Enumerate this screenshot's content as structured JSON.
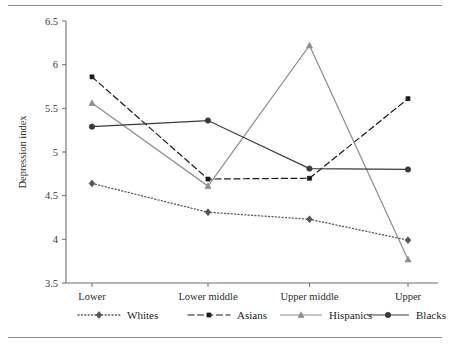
{
  "figure": {
    "has_top_rule": true,
    "has_bottom_rule": true,
    "rule_color": "#8a8a8a",
    "background": "#ffffff"
  },
  "axes": {
    "y_title": "Depression index",
    "y_ticks": [
      "6.5",
      "6",
      "5.5",
      "5",
      "4.5",
      "4",
      "3.5"
    ],
    "x_ticks": [
      "Lower",
      "Lower middle",
      "Upper middle",
      "Upper"
    ]
  },
  "legend": {
    "position": "bottom",
    "entries": [
      {
        "label": "Whites",
        "style": "dotted",
        "marker": "diamond",
        "color": "#555555"
      },
      {
        "label": "Asians",
        "style": "dashed",
        "marker": "square",
        "color": "#1a1a1a"
      },
      {
        "label": "Hispanics",
        "style": "solid",
        "marker": "triangle",
        "color": "#8e8e8e"
      },
      {
        "label": "Blacks",
        "style": "solid",
        "marker": "circle",
        "color": "#3a3a3a"
      }
    ]
  },
  "chart_data": {
    "type": "line",
    "title": "",
    "xlabel": "",
    "ylabel": "Depression index",
    "categories": [
      "Lower",
      "Lower middle",
      "Upper middle",
      "Upper"
    ],
    "ylim": [
      3.5,
      6.5
    ],
    "ytick_step": 0.5,
    "grid": false,
    "legend_position": "bottom",
    "series": [
      {
        "name": "Whites",
        "values": [
          4.64,
          4.31,
          4.23,
          3.99
        ],
        "line_style": "dotted",
        "marker": "diamond",
        "color": "#555555"
      },
      {
        "name": "Asians",
        "values": [
          5.86,
          4.69,
          4.7,
          5.61
        ],
        "line_style": "dashed",
        "marker": "square",
        "color": "#1a1a1a"
      },
      {
        "name": "Hispanics",
        "values": [
          5.56,
          4.61,
          6.22,
          3.77
        ],
        "line_style": "solid",
        "marker": "triangle",
        "color": "#8e8e8e"
      },
      {
        "name": "Blacks",
        "values": [
          5.29,
          5.36,
          4.81,
          4.8
        ],
        "line_style": "solid",
        "marker": "circle",
        "color": "#3a3a3a"
      }
    ]
  }
}
